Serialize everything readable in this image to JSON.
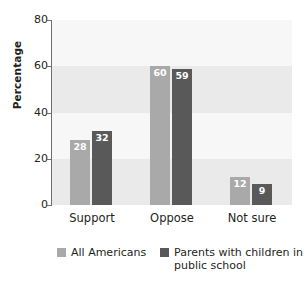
{
  "chart_data": {
    "type": "bar",
    "title": "",
    "subtitle": "",
    "xlabel": "",
    "ylabel": "Percentage",
    "categories": [
      "Support",
      "Oppose",
      "Not sure"
    ],
    "series": [
      {
        "name": "All Americans",
        "color": "#a9a9a9",
        "values": [
          28,
          60,
          12
        ]
      },
      {
        "name": "Parents with children in public school",
        "color": "#595959",
        "values": [
          32,
          59,
          9
        ]
      }
    ],
    "ylim": [
      0,
      80
    ],
    "yticks": [
      0,
      20,
      40,
      60,
      80
    ],
    "ytick_labels": [
      "0",
      "20",
      "40",
      "60",
      "80"
    ],
    "grid": false,
    "banded_background": true,
    "band_colors": [
      "#eaeaea",
      "#f7f7f7"
    ],
    "legend_position": "bottom",
    "value_labels": true,
    "value_label_color": "#ffffff"
  },
  "legend": {
    "items": [
      {
        "label": "All Americans",
        "color": "#a9a9a9"
      },
      {
        "label": "Parents with children in public school",
        "color": "#595959"
      }
    ]
  },
  "axes": {
    "y_title": "Percentage",
    "y_tick_0": "0",
    "y_tick_1": "20",
    "y_tick_2": "40",
    "y_tick_3": "60",
    "y_tick_4": "80"
  },
  "categories": {
    "c0": "Support",
    "c1": "Oppose",
    "c2": "Not sure"
  },
  "values": {
    "support_all": "28",
    "support_parents": "32",
    "oppose_all": "60",
    "oppose_parents": "59",
    "notsure_all": "12",
    "notsure_parents": "9"
  }
}
